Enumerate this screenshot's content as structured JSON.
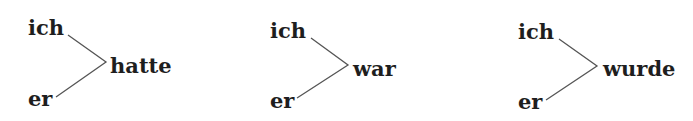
{
  "diagrams": [
    {
      "subject_top": "ich",
      "subject_bottom": "er",
      "verb": "hatte"
    },
    {
      "subject_top": "ich",
      "subject_bottom": "er",
      "verb": "war"
    },
    {
      "subject_top": "ich",
      "subject_bottom": "er",
      "verb": "wurde"
    }
  ],
  "line_color": "#555555"
}
